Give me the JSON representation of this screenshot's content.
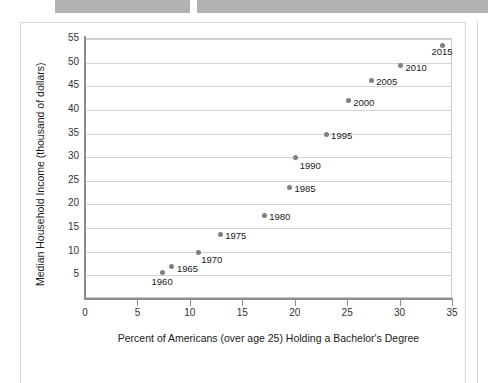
{
  "top_bars": {
    "left_bar": "",
    "right_bar": ""
  },
  "chart_data": {
    "type": "scatter",
    "title": "",
    "xlabel": "Percent of Americans (over age 25) Holding a Bachelor's Degree",
    "ylabel": "Median Household Income (thousand of dollars)",
    "xlim": [
      0,
      35
    ],
    "ylim": [
      0,
      55
    ],
    "xticks": [
      0,
      5,
      10,
      15,
      20,
      25,
      30,
      35
    ],
    "xtick_labels": [
      "0",
      "5",
      "10",
      "15",
      "20",
      "25",
      "30",
      "35"
    ],
    "yticks": [
      5,
      10,
      15,
      20,
      25,
      30,
      35,
      40,
      45,
      50,
      55
    ],
    "ytick_labels": [
      "5",
      "10",
      "15",
      "20",
      "25",
      "30",
      "35",
      "40",
      "45",
      "50",
      "55"
    ],
    "grid": "horizontal",
    "legend": "none",
    "marker_color": "#7f7f7f",
    "gridline_color": "#d3d3d3",
    "axis_color": "#8c8c8c",
    "points": [
      {
        "label": "1960",
        "x": 7.3,
        "y": 5.6,
        "label_dx": -11,
        "label_dy": 9
      },
      {
        "label": "1965",
        "x": 8.2,
        "y": 6.9,
        "label_dx": 5,
        "label_dy": 3
      },
      {
        "label": "1970",
        "x": 10.7,
        "y": 9.9,
        "label_dx": 3,
        "label_dy": 8
      },
      {
        "label": "1975",
        "x": 12.8,
        "y": 13.7,
        "label_dx": 5,
        "label_dy": 2
      },
      {
        "label": "1980",
        "x": 17.0,
        "y": 17.7,
        "label_dx": 5,
        "label_dy": 2
      },
      {
        "label": "1985",
        "x": 19.4,
        "y": 23.6,
        "label_dx": 5,
        "label_dy": 2
      },
      {
        "label": "1990",
        "x": 20.0,
        "y": 29.9,
        "label_dx": 4,
        "label_dy": 8
      },
      {
        "label": "1995",
        "x": 22.9,
        "y": 34.8,
        "label_dx": 5,
        "label_dy": 2
      },
      {
        "label": "2000",
        "x": 25.0,
        "y": 41.9,
        "label_dx": 5,
        "label_dy": 2
      },
      {
        "label": "2005",
        "x": 27.2,
        "y": 46.3,
        "label_dx": 5,
        "label_dy": 2
      },
      {
        "label": "2010",
        "x": 30.0,
        "y": 49.3,
        "label_dx": 5,
        "label_dy": 2
      },
      {
        "label": "2015",
        "x": 34.0,
        "y": 53.7,
        "label_dx": -11,
        "label_dy": 7
      }
    ]
  }
}
